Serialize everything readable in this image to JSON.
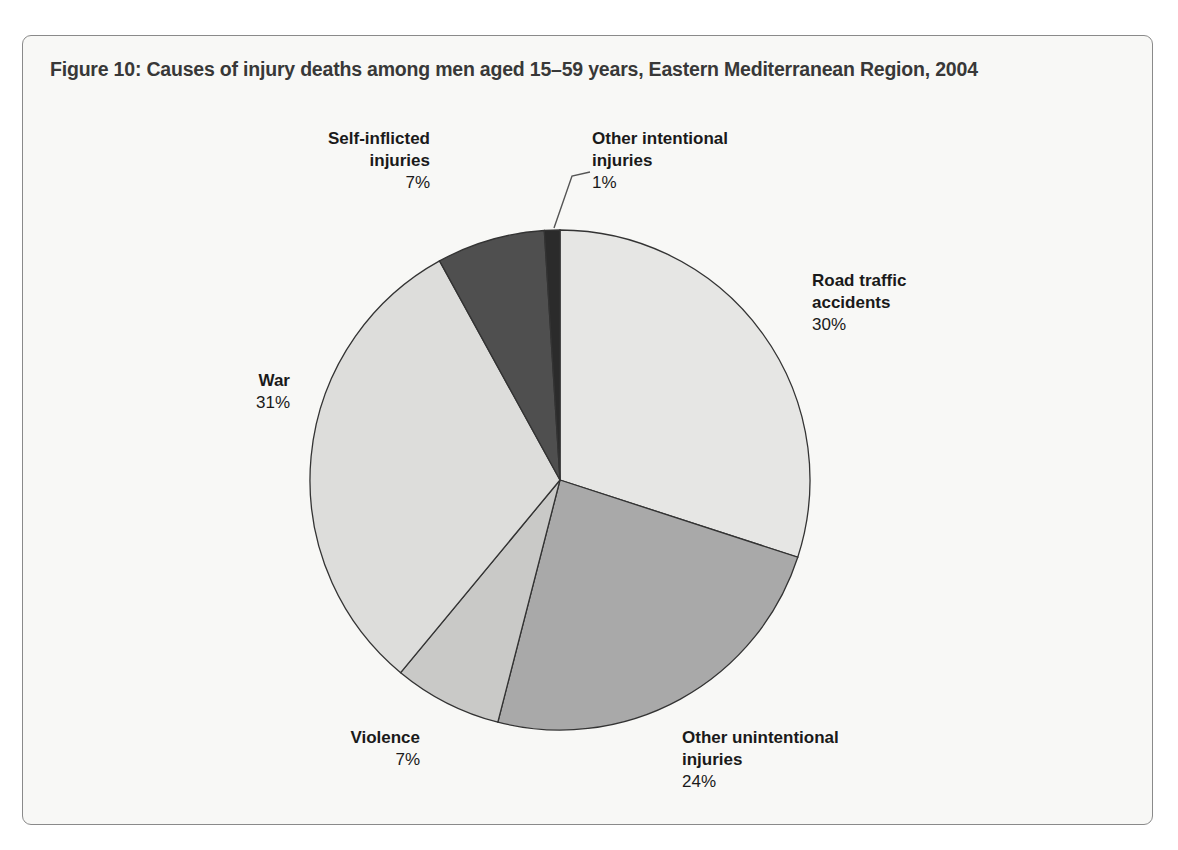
{
  "figure": {
    "title": "Figure 10: Causes of injury deaths among men aged 15–59 years, Eastern Mediterranean Region, 2004",
    "frame_border_color": "#8a8a8a",
    "background_color": "#f8f8f6",
    "title_color": "#383838"
  },
  "chart_data": {
    "type": "pie",
    "title": "Figure 10: Causes of injury deaths among men aged 15–59 years, Eastern Mediterranean Region, 2004",
    "xlabel": "",
    "ylabel": "",
    "unit": "%",
    "total": 100,
    "start_angle_deg": 0,
    "direction": "clockwise",
    "legend_position": "outside-labels",
    "grid": false,
    "categories": [
      "Road traffic accidents",
      "Other unintentional injuries",
      "Violence",
      "War",
      "Self-inflicted injuries",
      "Other intentional injuries"
    ],
    "values": [
      30,
      24,
      7,
      31,
      7,
      1
    ],
    "colors": [
      "#e6e6e4",
      "#a9a9a9",
      "#c9c9c7",
      "#dddddb",
      "#4f4f4f",
      "#2b2b2b"
    ],
    "slices": [
      {
        "name": "Road traffic accidents",
        "label_line1": "Road traffic",
        "label_line2": "accidents",
        "value": 30,
        "value_text": "30%",
        "color": "#e6e6e4",
        "align": "left",
        "has_leader_line": false
      },
      {
        "name": "Other unintentional injuries",
        "label_line1": "Other unintentional",
        "label_line2": "injuries",
        "value": 24,
        "value_text": "24%",
        "color": "#a9a9a9",
        "align": "left",
        "has_leader_line": false
      },
      {
        "name": "Violence",
        "label_line1": "Violence",
        "label_line2": "",
        "value": 7,
        "value_text": "7%",
        "color": "#c9c9c7",
        "align": "right",
        "has_leader_line": false
      },
      {
        "name": "War",
        "label_line1": "War",
        "label_line2": "",
        "value": 31,
        "value_text": "31%",
        "color": "#dddddb",
        "align": "right",
        "has_leader_line": false
      },
      {
        "name": "Self-inflicted injuries",
        "label_line1": "Self-inflicted",
        "label_line2": "injuries",
        "value": 7,
        "value_text": "7%",
        "color": "#4f4f4f",
        "align": "right",
        "has_leader_line": false
      },
      {
        "name": "Other intentional injuries",
        "label_line1": "Other intentional",
        "label_line2": "injuries",
        "value": 1,
        "value_text": "1%",
        "color": "#2b2b2b",
        "align": "left",
        "has_leader_line": true
      }
    ]
  }
}
